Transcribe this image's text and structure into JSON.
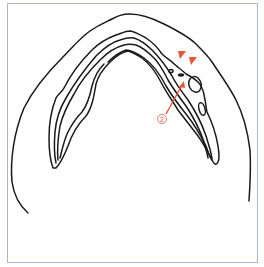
{
  "figure": {
    "frame_color": "#a9b6cf",
    "line_color": "#1a1a1a",
    "annotation_color": "#e8553a"
  },
  "annotations": {
    "arrowheads": [
      {
        "name": "arrowhead-1",
        "x": 182,
        "y": 56
      },
      {
        "name": "arrowhead-2",
        "x": 193,
        "y": 61
      }
    ],
    "callout": {
      "label": "2",
      "x": 162,
      "y": 119
    }
  }
}
